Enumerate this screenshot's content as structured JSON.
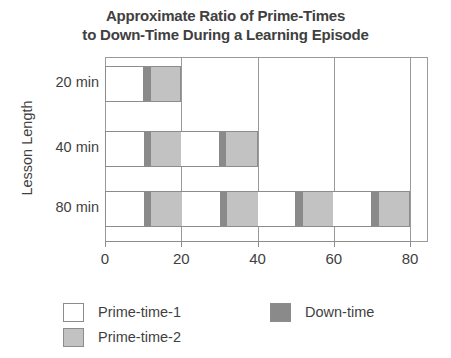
{
  "chart_data": {
    "type": "bar",
    "orientation": "horizontal",
    "stacked": true,
    "title": "Approximate Ratio of Prime-Times to Down-Time During a Learning Episode",
    "title_lines": [
      "Approximate Ratio of Prime-Times",
      "to Down-Time During a Learning Episode"
    ],
    "xlabel": "",
    "ylabel": "Lesson Length",
    "categories": [
      "20 min",
      "40 min",
      "80 min"
    ],
    "xlim": [
      0,
      80
    ],
    "xticks": [
      0,
      20,
      40,
      60,
      80
    ],
    "xtick_labels": [
      "0",
      "20",
      "40",
      "60",
      "80"
    ],
    "grid": "vertical",
    "legend_position": "bottom-left",
    "series": [
      {
        "name": "Prime-time-1",
        "color": "#ffffff"
      },
      {
        "name": "Prime-time-2",
        "color": "#c2c2c2"
      },
      {
        "name": "Down-time",
        "color": "#8a8a8a"
      }
    ],
    "cycle_minutes": 20,
    "cycle_pattern": [
      {
        "series": "Prime-time-1",
        "minutes": 10
      },
      {
        "series": "Down-time",
        "minutes": 2
      },
      {
        "series": "Prime-time-2",
        "minutes": 8
      }
    ],
    "bars": [
      {
        "category": "20 min",
        "total": 20,
        "cycles": 1,
        "segments": [
          {
            "series": "Prime-time-1",
            "start": 0,
            "end": 10,
            "minutes": 10
          },
          {
            "series": "Down-time",
            "start": 10,
            "end": 12,
            "minutes": 2
          },
          {
            "series": "Prime-time-2",
            "start": 12,
            "end": 20,
            "minutes": 8
          }
        ]
      },
      {
        "category": "40 min",
        "total": 40,
        "cycles": 2,
        "segments": [
          {
            "series": "Prime-time-1",
            "start": 0,
            "end": 10,
            "minutes": 10
          },
          {
            "series": "Down-time",
            "start": 10,
            "end": 12,
            "minutes": 2
          },
          {
            "series": "Prime-time-2",
            "start": 12,
            "end": 20,
            "minutes": 8
          },
          {
            "series": "Prime-time-1",
            "start": 20,
            "end": 30,
            "minutes": 10
          },
          {
            "series": "Down-time",
            "start": 30,
            "end": 32,
            "minutes": 2
          },
          {
            "series": "Prime-time-2",
            "start": 32,
            "end": 40,
            "minutes": 8
          }
        ]
      },
      {
        "category": "80 min",
        "total": 80,
        "cycles": 4,
        "segments": [
          {
            "series": "Prime-time-1",
            "start": 0,
            "end": 10,
            "minutes": 10
          },
          {
            "series": "Down-time",
            "start": 10,
            "end": 12,
            "minutes": 2
          },
          {
            "series": "Prime-time-2",
            "start": 12,
            "end": 20,
            "minutes": 8
          },
          {
            "series": "Prime-time-1",
            "start": 20,
            "end": 30,
            "minutes": 10
          },
          {
            "series": "Down-time",
            "start": 30,
            "end": 32,
            "minutes": 2
          },
          {
            "series": "Prime-time-2",
            "start": 32,
            "end": 40,
            "minutes": 8
          },
          {
            "series": "Prime-time-1",
            "start": 40,
            "end": 50,
            "minutes": 10
          },
          {
            "series": "Down-time",
            "start": 50,
            "end": 52,
            "minutes": 2
          },
          {
            "series": "Prime-time-2",
            "start": 52,
            "end": 60,
            "minutes": 8
          },
          {
            "series": "Prime-time-1",
            "start": 60,
            "end": 70,
            "minutes": 10
          },
          {
            "series": "Down-time",
            "start": 70,
            "end": 72,
            "minutes": 2
          },
          {
            "series": "Prime-time-2",
            "start": 72,
            "end": 80,
            "minutes": 8
          }
        ]
      }
    ],
    "legend": [
      {
        "label": "Prime-time-1",
        "color": "#ffffff"
      },
      {
        "label": "Prime-time-2",
        "color": "#c2c2c2"
      },
      {
        "label": "Down-time",
        "color": "#8a8a8a"
      }
    ],
    "colors": {
      "prime_time_1": "#ffffff",
      "prime_time_2": "#c2c2c2",
      "down_time": "#8a8a8a",
      "axis": "#8c8c8c",
      "text": "#3f3f3f"
    }
  }
}
